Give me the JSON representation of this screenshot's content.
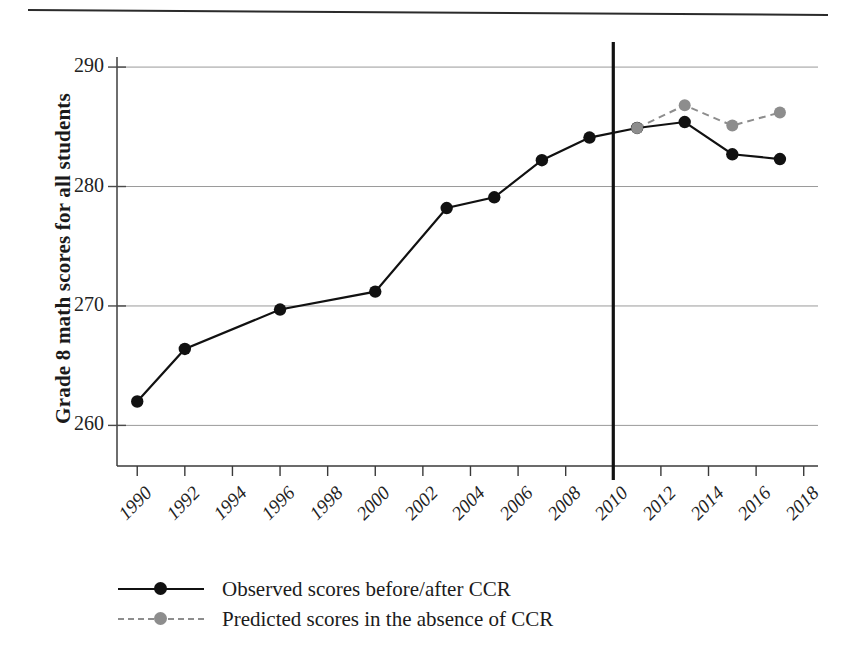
{
  "figure": {
    "has_top_rule": true,
    "background": "#ffffff"
  },
  "chart_data": {
    "type": "line",
    "title": "",
    "xlabel": "",
    "ylabel": "Grade 8 math scores for all students",
    "xlim": [
      1989,
      2018.5
    ],
    "ylim": [
      258,
      291.5
    ],
    "yticks": [
      260,
      270,
      280,
      290
    ],
    "xticks": [
      1990,
      1992,
      1994,
      1996,
      1998,
      2000,
      2002,
      2004,
      2006,
      2008,
      2010,
      2012,
      2014,
      2016,
      2018
    ],
    "xtick_labels": [
      "1990",
      "1992",
      "1994",
      "1996",
      "1998",
      "2000",
      "2002",
      "2004",
      "2006",
      "2008",
      "2010",
      "2012",
      "2014",
      "2016",
      "2018"
    ],
    "ytick_labels": [
      "260",
      "270",
      "280",
      "290"
    ],
    "grid": "horizontal",
    "legend_position": "below-axes",
    "annotations": [
      {
        "name": "ccr-vertical-line",
        "type": "vline",
        "x": 2010,
        "label": "",
        "color": "#111111"
      }
    ],
    "series": [
      {
        "name": "Observed scores before/after CCR",
        "style": "solid",
        "color": "#111111",
        "marker": "circle",
        "x": [
          1990,
          1992,
          1996,
          2000,
          2003,
          2005,
          2007,
          2009,
          2011,
          2013,
          2015,
          2017
        ],
        "values": [
          262.0,
          266.4,
          269.7,
          271.2,
          278.2,
          279.1,
          282.2,
          284.1,
          284.9,
          285.4,
          282.7,
          282.3
        ]
      },
      {
        "name": "Predicted scores in the absence of CCR",
        "style": "dashed",
        "color": "#8d8d8d",
        "marker": "circle",
        "x": [
          2011,
          2013,
          2015,
          2017
        ],
        "values": [
          284.9,
          286.8,
          285.1,
          286.2
        ]
      }
    ]
  },
  "legend": {
    "entries": [
      {
        "label": "Observed scores before/after CCR",
        "color": "#111111",
        "style": "solid"
      },
      {
        "label": "Predicted scores in the absence of CCR",
        "color": "#8d8d8d",
        "style": "dashed"
      }
    ]
  },
  "axes": {
    "y_title": "Grade 8 math scores for all students"
  }
}
